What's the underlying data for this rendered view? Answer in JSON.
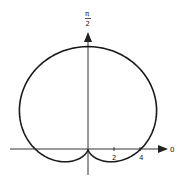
{
  "chart_data": {
    "type": "line",
    "subtype": "polar",
    "equation": "r = 4(1 + sin θ)",
    "title": "",
    "axis_labels": {
      "polar_axis": "0",
      "vertical_axis": "π/2"
    },
    "x_ticks": [
      2,
      4
    ],
    "x_tick_labels": [
      "2",
      "4"
    ],
    "series": [
      {
        "name": "cardioid",
        "a": 4,
        "points_description": "cusp at origin, max r = 8 at θ = π/2, crosses polar axis at r = 4 (θ=0 and θ=π), dips to y = -1 below polar axis"
      }
    ],
    "key_points": [
      {
        "theta": "0",
        "r": 4
      },
      {
        "theta": "π/2",
        "r": 8
      },
      {
        "theta": "π",
        "r": 4
      },
      {
        "theta": "3π/2",
        "r": 0
      }
    ],
    "grid": false,
    "legend": null
  },
  "labels": {
    "pi": "π",
    "two": "2",
    "zero": "0",
    "tick2": "2",
    "tick4": "4"
  },
  "colors": {
    "curve": "#1a1a1a",
    "axis": "#333333"
  }
}
